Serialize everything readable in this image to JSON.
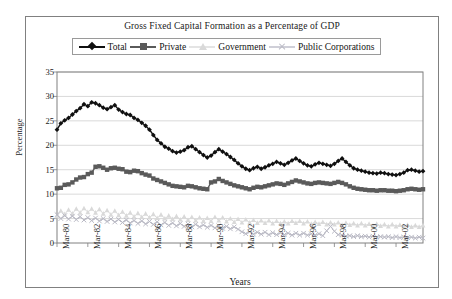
{
  "figure": {
    "title": "Gross Fixed Capital Formation as a Percentage of GDP",
    "xlabel": "Years",
    "ylabel": "Percentage"
  },
  "legend": {
    "entries": [
      {
        "label": "Total",
        "marker": "diamond",
        "color": "#101010",
        "line": true
      },
      {
        "label": "Private",
        "marker": "square",
        "color": "#5a5a5a",
        "line": true
      },
      {
        "label": "Government",
        "marker": "triangle",
        "color": "#d9d9d9",
        "line": true
      },
      {
        "label": "Public Corporations",
        "marker": "x",
        "color": "#b9b9c4",
        "line": true
      }
    ]
  },
  "chart_data": {
    "type": "line",
    "title": "Gross Fixed Capital Formation as a Percentage of GDP",
    "xlabel": "Years",
    "ylabel": "Percentage",
    "ylim": [
      0,
      35
    ],
    "ytick_values": [
      0,
      5,
      10,
      15,
      20,
      25,
      30,
      35
    ],
    "grid": "horizontal",
    "legend_position": "top",
    "x_tick_labels": [
      "Mar-80",
      "Mar-82",
      "Mar-84",
      "Mar-86",
      "Mar-88",
      "Mar-90",
      "Mar-92",
      "Mar-94",
      "Mar-96",
      "Mar-98",
      "Mar-00",
      "Mar-02"
    ],
    "x_tick_index": [
      0,
      8,
      16,
      24,
      32,
      40,
      48,
      56,
      64,
      72,
      80,
      88
    ],
    "x_start": "Mar-80",
    "x_end": "Dec-03",
    "x_frequency": "quarterly",
    "n_points": 96,
    "series": [
      {
        "name": "Total",
        "marker": "diamond",
        "color": "#101010",
        "values": [
          23.2,
          24.5,
          25.1,
          25.6,
          26.3,
          27.0,
          27.6,
          28.4,
          28.0,
          28.8,
          28.6,
          28.2,
          27.7,
          27.4,
          27.8,
          28.2,
          27.3,
          26.8,
          26.4,
          26.2,
          25.6,
          25.2,
          24.6,
          24.0,
          23.2,
          22.1,
          21.1,
          20.4,
          19.7,
          19.3,
          18.8,
          18.5,
          18.7,
          19.0,
          19.6,
          19.8,
          19.2,
          18.6,
          18.0,
          17.5,
          17.9,
          18.6,
          19.2,
          18.7,
          18.2,
          17.6,
          17.0,
          16.3,
          15.7,
          15.2,
          14.9,
          15.3,
          15.6,
          15.2,
          15.5,
          15.9,
          16.2,
          16.6,
          16.3,
          16.0,
          16.4,
          16.9,
          17.3,
          16.8,
          16.3,
          15.9,
          15.7,
          16.1,
          16.4,
          16.2,
          16.0,
          15.8,
          16.2,
          16.8,
          17.3,
          16.6,
          15.9,
          15.3,
          15.0,
          14.8,
          14.6,
          14.4,
          14.3,
          14.2,
          14.4,
          14.3,
          14.1,
          14.0,
          13.9,
          14.1,
          14.4,
          14.9,
          15.0,
          14.8,
          14.6,
          14.7
        ]
      },
      {
        "name": "Private",
        "marker": "square",
        "color": "#5a5a5a",
        "values": [
          11.2,
          11.3,
          11.9,
          12.0,
          12.4,
          13.0,
          13.4,
          13.5,
          14.1,
          14.4,
          15.6,
          15.7,
          15.4,
          15.0,
          15.3,
          15.4,
          15.2,
          15.1,
          14.6,
          14.5,
          14.8,
          14.7,
          14.3,
          14.0,
          13.8,
          13.2,
          12.9,
          12.6,
          12.3,
          12.0,
          11.7,
          11.6,
          11.5,
          11.4,
          11.7,
          11.6,
          11.4,
          11.2,
          11.1,
          11.0,
          12.4,
          12.6,
          13.1,
          12.7,
          12.4,
          12.1,
          11.8,
          11.6,
          11.4,
          11.2,
          11.0,
          11.3,
          11.5,
          11.4,
          11.6,
          11.8,
          12.0,
          12.2,
          12.1,
          11.9,
          12.2,
          12.5,
          12.8,
          12.6,
          12.4,
          12.2,
          12.1,
          12.3,
          12.4,
          12.3,
          12.2,
          12.1,
          12.3,
          12.5,
          12.3,
          12.0,
          11.6,
          11.3,
          11.1,
          11.0,
          10.9,
          10.8,
          10.8,
          10.7,
          10.8,
          10.8,
          10.7,
          10.7,
          10.6,
          10.7,
          10.8,
          11.0,
          11.1,
          11.0,
          10.9,
          11.0
        ]
      },
      {
        "name": "Government",
        "marker": "triangle",
        "color": "#d9d9d9",
        "values": [
          5.4,
          6.6,
          5.9,
          6.8,
          6.0,
          7.0,
          6.2,
          7.1,
          6.3,
          7.0,
          6.2,
          6.9,
          6.0,
          6.7,
          5.8,
          6.6,
          5.7,
          6.4,
          5.6,
          6.2,
          5.4,
          6.1,
          5.3,
          6.0,
          5.2,
          5.9,
          5.1,
          5.8,
          5.0,
          5.6,
          4.9,
          5.5,
          4.8,
          5.4,
          4.7,
          5.3,
          4.6,
          5.2,
          4.5,
          5.1,
          4.5,
          5.3,
          4.6,
          5.2,
          4.4,
          5.0,
          4.3,
          4.9,
          4.2,
          4.8,
          4.2,
          4.7,
          4.1,
          4.6,
          4.1,
          4.6,
          4.0,
          4.5,
          4.0,
          4.4,
          4.0,
          4.5,
          4.1,
          4.5,
          4.0,
          4.4,
          3.9,
          4.3,
          3.9,
          4.3,
          3.8,
          4.2,
          3.8,
          4.2,
          3.7,
          4.1,
          3.7,
          4.0,
          3.6,
          4.0,
          3.6,
          3.9,
          3.5,
          3.9,
          3.5,
          3.8,
          3.4,
          3.8,
          3.4,
          3.7,
          3.4,
          3.7,
          3.3,
          3.6,
          3.3,
          3.6
        ]
      },
      {
        "name": "Public Corporations",
        "marker": "x",
        "color": "#b9b9c4",
        "values": [
          5.8,
          5.0,
          5.6,
          4.9,
          5.5,
          4.8,
          5.4,
          4.7,
          5.2,
          4.6,
          5.1,
          4.5,
          5.0,
          4.4,
          4.9,
          4.3,
          4.8,
          4.2,
          4.7,
          4.1,
          4.6,
          4.0,
          4.5,
          3.9,
          4.4,
          3.8,
          4.3,
          3.7,
          4.2,
          3.6,
          4.1,
          3.5,
          4.0,
          3.4,
          3.9,
          3.3,
          3.8,
          3.3,
          3.7,
          3.2,
          3.6,
          3.1,
          3.5,
          3.0,
          3.4,
          2.9,
          3.3,
          2.8,
          2.3,
          1.9,
          2.3,
          1.8,
          2.2,
          1.8,
          2.2,
          1.7,
          2.1,
          1.7,
          2.1,
          1.7,
          2.0,
          1.6,
          2.0,
          1.6,
          2.0,
          1.6,
          1.9,
          1.6,
          1.9,
          1.5,
          2.5,
          3.4,
          2.4,
          1.7,
          1.6,
          1.4,
          1.5,
          1.3,
          1.5,
          1.3,
          1.4,
          1.2,
          1.4,
          1.2,
          1.3,
          1.2,
          1.3,
          1.1,
          1.3,
          1.1,
          1.2,
          1.1,
          1.2,
          1.0,
          1.2,
          1.0
        ]
      }
    ]
  },
  "plot_geometry": {
    "left": 57,
    "right": 423,
    "top": 72,
    "bottom": 243
  }
}
